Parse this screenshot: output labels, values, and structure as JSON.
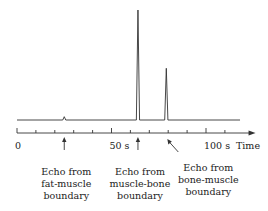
{
  "chart_data": {
    "type": "line",
    "title": "",
    "xlabel": "Time",
    "x_unit": "s",
    "xlim": [
      0,
      122
    ],
    "tick_step": 10,
    "tick_labels": [
      {
        "value": 0,
        "text": "0"
      },
      {
        "value": 50,
        "text": "50  s"
      },
      {
        "value": 100,
        "text": "100  s"
      }
    ],
    "baseline": {
      "start": 0,
      "end": 118
    },
    "peaks": [
      {
        "name": "fat-muscle",
        "x": 25,
        "relative_height": 0.03
      },
      {
        "name": "muscle-bone",
        "x": 64,
        "relative_height": 1.0
      },
      {
        "name": "bone-muscle",
        "x": 79,
        "relative_height": 0.47
      }
    ],
    "annotations": [
      {
        "lines": [
          "Echo from",
          "fat-muscle",
          "boundary"
        ],
        "x": 25
      },
      {
        "lines": [
          "Echo from",
          "muscle-bone",
          "boundary"
        ],
        "x": 64
      },
      {
        "lines": [
          "Echo from",
          "bone-muscle",
          "boundary"
        ],
        "x": 79
      }
    ]
  }
}
